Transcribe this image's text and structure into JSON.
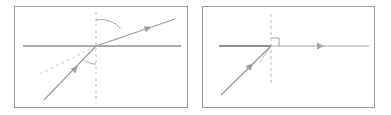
{
  "figure": {
    "panel_count": 2,
    "background_color": "#ffffff",
    "border_color": "#9a9a9a"
  },
  "colors": {
    "ray_stroke": "#9b9b9b",
    "surface_stroke": "#8f8f8f",
    "normal_dashed": "#bdbdbd",
    "extension_dashed": "#c8c8c8",
    "arc_stroke": "#a8a8a8",
    "right_angle_stroke": "#a0a0a0",
    "panel_border": "#9a9a9a"
  },
  "panels": [
    {
      "id": "panel-left",
      "name": "refraction-with-angles-panel",
      "caption": "",
      "x": 14,
      "y": 6,
      "width": 174,
      "height": 102,
      "elements": {
        "surface_line": {
          "name": "interface-surface-line",
          "x1": 8,
          "y1": 39,
          "x2": 166,
          "y2": 39,
          "stroke_width": 1.3
        },
        "normal_line": {
          "name": "normal-dashed-line",
          "x1": 81,
          "y1": 5,
          "x2": 81,
          "y2": 96,
          "dash": "3,3",
          "stroke_width": 1
        },
        "incident_ray": {
          "name": "incident-ray",
          "x1": 29,
          "y1": 93,
          "x2": 81,
          "y2": 39,
          "arrow_at": 0.56,
          "stroke_width": 1.2,
          "direction": "up-right"
        },
        "refracted_ray": {
          "name": "refracted-ray",
          "x1": 81,
          "y1": 39,
          "x2": 160,
          "y2": 12,
          "arrow_at": 0.62,
          "stroke_width": 1.2,
          "direction": "up-right"
        },
        "extension_dashed_ray": {
          "name": "incident-extension-dashed-line",
          "x1": 81,
          "y1": 39,
          "x2": 23,
          "y2": 68,
          "dash": "3,3",
          "stroke_width": 1
        },
        "angle_arc_upper": {
          "name": "refraction-angle-arc",
          "center_x": 81,
          "center_y": 39,
          "radius": 26,
          "start_deg": 90,
          "end_deg": 19,
          "label": ""
        },
        "angle_arc_lower": {
          "name": "incidence-angle-arc",
          "center_x": 81,
          "center_y": 39,
          "radius": 18,
          "start_deg": 270,
          "end_deg": 226,
          "label": ""
        }
      }
    },
    {
      "id": "panel-right",
      "name": "refraction-right-angle-panel",
      "caption": "",
      "x": 202,
      "y": 6,
      "width": 173,
      "height": 102,
      "elements": {
        "surface_line_thick": {
          "name": "interface-surface-line-left",
          "x1": 16,
          "y1": 39,
          "x2": 68,
          "y2": 39,
          "stroke_width": 2.0
        },
        "surface_line_thin": {
          "name": "interface-surface-line-right",
          "x1": 68,
          "y1": 39,
          "x2": 166,
          "y2": 39,
          "stroke_width": 1.1
        },
        "normal_line": {
          "name": "normal-dashed-line",
          "x1": 68,
          "y1": 7,
          "x2": 68,
          "y2": 78,
          "dash": "3,3",
          "stroke_width": 1
        },
        "incident_ray": {
          "name": "incident-ray",
          "x1": 18,
          "y1": 88,
          "x2": 68,
          "y2": 39,
          "arrow_at": 0.54,
          "stroke_width": 1.3,
          "direction": "up-right"
        },
        "outgoing_ray": {
          "name": "outgoing-ray",
          "x1": 68,
          "y1": 39,
          "x2": 166,
          "y2": 39,
          "arrow_at": 0.52,
          "stroke_width": 1.0,
          "direction": "right"
        },
        "right_angle_marker": {
          "name": "right-angle-marker",
          "corner_x": 68,
          "corner_y": 39,
          "size": 8,
          "orientation": "up-right"
        },
        "angle_tick_lower": {
          "name": "incidence-angle-tick",
          "x1": 68,
          "y1": 39,
          "x2": 56,
          "y2": 56,
          "stroke_width": 1
        }
      }
    }
  ]
}
